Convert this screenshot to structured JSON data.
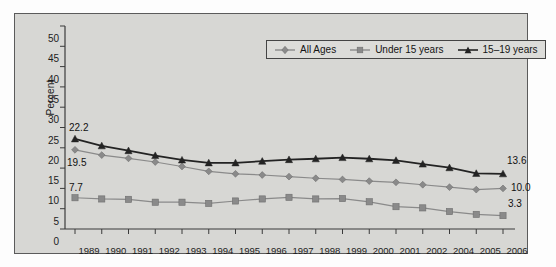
{
  "chart_data": {
    "type": "line",
    "title": "",
    "subtitle": "",
    "xlabel": "",
    "ylabel": "Percent",
    "ylim": [
      0,
      50
    ],
    "ytick_step": 5,
    "yticks": [
      0,
      5,
      10,
      15,
      20,
      25,
      30,
      35,
      40,
      45,
      50
    ],
    "grid": false,
    "legend_position": "top-right",
    "categories": [
      "1989",
      "1990",
      "1991",
      "1992",
      "1993",
      "1994",
      "1995",
      "1996",
      "1997",
      "1998",
      "1999",
      "2000",
      "2001",
      "2002",
      "2004",
      "2005",
      "2006"
    ],
    "series": [
      {
        "name": "All Ages",
        "marker": "diamond",
        "color": "#8a8a8a",
        "values": [
          19.5,
          18.2,
          17.4,
          16.5,
          15.4,
          14.2,
          13.6,
          13.3,
          12.9,
          12.5,
          12.2,
          11.8,
          11.5,
          10.9,
          10.3,
          9.7,
          10.0
        ]
      },
      {
        "name": "Under 15 years",
        "marker": "square",
        "color": "#8a8a8a",
        "values": [
          7.7,
          7.4,
          7.3,
          6.6,
          6.6,
          6.3,
          6.9,
          7.4,
          7.8,
          7.4,
          7.5,
          6.7,
          5.5,
          5.2,
          4.3,
          3.6,
          3.3
        ]
      },
      {
        "name": "15–19 years",
        "marker": "triangle",
        "color": "#232323",
        "values": [
          22.2,
          20.5,
          19.3,
          18.1,
          17.0,
          16.3,
          16.3,
          16.7,
          17.1,
          17.3,
          17.6,
          17.3,
          16.9,
          16.0,
          15.1,
          13.7,
          13.6
        ]
      }
    ],
    "start_labels": [
      {
        "text": "22.2",
        "series": "15–19 years"
      },
      {
        "text": "19.5",
        "series": "All Ages"
      },
      {
        "text": "7.7",
        "series": "Under 15 years"
      }
    ],
    "end_labels": [
      {
        "text": "13.6",
        "series": "15–19 years"
      },
      {
        "text": "10.0",
        "series": "All Ages"
      },
      {
        "text": "3.3",
        "series": "Under 15 years"
      }
    ]
  },
  "legend": {
    "items": [
      {
        "label": "All Ages"
      },
      {
        "label": "Under 15 years"
      },
      {
        "label": "15–19 years"
      }
    ]
  },
  "axis": {
    "ylabel": "Percent",
    "yticks": [
      "50",
      "45",
      "40",
      "35",
      "30",
      "25",
      "20",
      "15",
      "10",
      "5",
      "0"
    ],
    "xticks": [
      "1989",
      "1990",
      "1991",
      "1992",
      "1993",
      "1994",
      "1995",
      "1996",
      "1997",
      "1998",
      "1999",
      "2000",
      "2001",
      "2002",
      "2004",
      "2005",
      "2006"
    ]
  },
  "annotations": {
    "start_22_2": "22.2",
    "start_19_5": "19.5",
    "start_7_7": "7.7",
    "end_13_6": "13.6",
    "end_10_0": "10.0",
    "end_3_3": "3.3"
  },
  "colors": {
    "panel_bg": "#d7d7d4",
    "frame": "#5b5b5b",
    "series_gray": "#8a8a8a",
    "series_dark": "#232323",
    "text": "#1c1c1c"
  }
}
